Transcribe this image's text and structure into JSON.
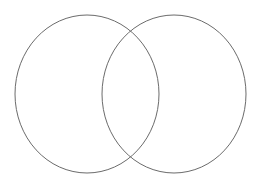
{
  "diagram": {
    "type": "venn",
    "sets": [
      {
        "id": "left",
        "label": "",
        "cx": 87,
        "cy": 94,
        "rx": 72,
        "ry": 79
      },
      {
        "id": "right",
        "label": "",
        "cx": 174,
        "cy": 94,
        "rx": 72,
        "ry": 79
      }
    ],
    "intersection_label": "",
    "stroke_color": "#6b6b6b",
    "fill_color": "none",
    "background": "#ffffff"
  }
}
